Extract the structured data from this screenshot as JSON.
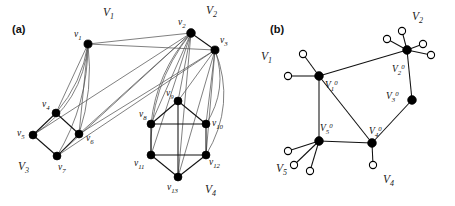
{
  "figure": {
    "panels": [
      {
        "id": "a",
        "label": "(a)",
        "label_x": 12,
        "label_y": 33,
        "set_labels": [
          {
            "name": "V1",
            "base": "V",
            "sub": "1",
            "x": 103,
            "y": 16
          },
          {
            "name": "V2",
            "base": "V",
            "sub": "2",
            "x": 206,
            "y": 14
          },
          {
            "name": "V3",
            "base": "V",
            "sub": "3",
            "x": 18,
            "y": 170
          },
          {
            "name": "V4",
            "base": "V",
            "sub": "4",
            "x": 205,
            "y": 193
          }
        ],
        "vertices": [
          {
            "id": "v1",
            "base": "v",
            "sub": "1",
            "x": 88,
            "y": 44,
            "r": 4.1,
            "lx": 74,
            "ly": 37
          },
          {
            "id": "v2",
            "base": "v",
            "sub": "2",
            "x": 191,
            "y": 33,
            "r": 4.4,
            "lx": 178,
            "ly": 25
          },
          {
            "id": "v3",
            "base": "v",
            "sub": "3",
            "x": 215,
            "y": 50,
            "r": 4.1,
            "lx": 220,
            "ly": 43
          },
          {
            "id": "v4",
            "base": "v",
            "sub": "4",
            "x": 56,
            "y": 113,
            "r": 4.0,
            "lx": 42,
            "ly": 107
          },
          {
            "id": "v5",
            "base": "v",
            "sub": "5",
            "x": 33,
            "y": 135,
            "r": 4.0,
            "lx": 17,
            "ly": 136
          },
          {
            "id": "v6",
            "base": "v",
            "sub": "6",
            "x": 79,
            "y": 134,
            "r": 4.0,
            "lx": 86,
            "ly": 141
          },
          {
            "id": "v7",
            "base": "v",
            "sub": "7",
            "x": 57,
            "y": 156,
            "r": 4.0,
            "lx": 58,
            "ly": 170
          },
          {
            "id": "v8",
            "base": "v",
            "sub": "8",
            "x": 151,
            "y": 124,
            "r": 4.0,
            "lx": 139,
            "ly": 117
          },
          {
            "id": "v9",
            "base": "v",
            "sub": "9",
            "x": 178,
            "y": 101,
            "r": 4.0,
            "lx": 166,
            "ly": 96
          },
          {
            "id": "v10",
            "base": "v",
            "sub": "10",
            "x": 206,
            "y": 124,
            "r": 4.0,
            "lx": 212,
            "ly": 126
          },
          {
            "id": "v11",
            "base": "v",
            "sub": "11",
            "x": 151,
            "y": 155,
            "r": 4.0,
            "lx": 134,
            "ly": 166
          },
          {
            "id": "v12",
            "base": "v",
            "sub": "12",
            "x": 206,
            "y": 155,
            "r": 4.0,
            "lx": 209,
            "ly": 165
          },
          {
            "id": "v13",
            "base": "v",
            "sub": "13",
            "x": 178,
            "y": 177,
            "r": 4.0,
            "lx": 167,
            "ly": 190
          }
        ],
        "edges_straight": [
          {
            "from": "v4",
            "to": "v5"
          },
          {
            "from": "v4",
            "to": "v6"
          },
          {
            "from": "v5",
            "to": "v7"
          },
          {
            "from": "v6",
            "to": "v7"
          },
          {
            "from": "v8",
            "to": "v9"
          },
          {
            "from": "v9",
            "to": "v10"
          },
          {
            "from": "v8",
            "to": "v10"
          },
          {
            "from": "v8",
            "to": "v11"
          },
          {
            "from": "v10",
            "to": "v12"
          },
          {
            "from": "v11",
            "to": "v12"
          },
          {
            "from": "v11",
            "to": "v13"
          },
          {
            "from": "v12",
            "to": "v13"
          },
          {
            "from": "v9",
            "to": "v13"
          },
          {
            "from": "v2",
            "to": "v3"
          }
        ],
        "edges_cross": [
          {
            "from": "v1",
            "to": "v2"
          },
          {
            "from": "v1",
            "to": "v3"
          },
          {
            "from": "v1",
            "to": "v4"
          },
          {
            "from": "v1",
            "to": "v6"
          },
          {
            "from": "v2",
            "to": "v5"
          },
          {
            "from": "v2",
            "to": "v6"
          },
          {
            "from": "v2",
            "to": "v7"
          },
          {
            "from": "v3",
            "to": "v6"
          },
          {
            "from": "v3",
            "to": "v7"
          },
          {
            "from": "v2",
            "to": "v8"
          },
          {
            "from": "v2",
            "to": "v9"
          },
          {
            "from": "v2",
            "to": "v11"
          },
          {
            "from": "v2",
            "to": "v13"
          },
          {
            "from": "v3",
            "to": "v9"
          },
          {
            "from": "v3",
            "to": "v10"
          },
          {
            "from": "v3",
            "to": "v13"
          },
          {
            "from": "v3",
            "to": "v12"
          }
        ],
        "edges_curved": [
          {
            "from": "v1",
            "to": "v5",
            "bow": -26
          },
          {
            "from": "v1",
            "to": "v7",
            "bow": -16
          },
          {
            "from": "v1",
            "to": "v4",
            "bow": -11
          },
          {
            "from": "v1",
            "to": "v6",
            "bow": -10
          },
          {
            "from": "v2",
            "to": "v8",
            "bow": 16
          },
          {
            "from": "v2",
            "to": "v11",
            "bow": 24
          },
          {
            "from": "v3",
            "to": "v10",
            "bow": -18
          },
          {
            "from": "v3",
            "to": "v12",
            "bow": -26
          }
        ]
      },
      {
        "id": "b",
        "label": "(b)",
        "label_x": 270,
        "label_y": 33,
        "set_labels": [
          {
            "name": "V1",
            "base": "V",
            "sub": "1",
            "x": 261,
            "y": 60
          },
          {
            "name": "V2",
            "base": "V",
            "sub": "2",
            "x": 412,
            "y": 20
          },
          {
            "name": "V4",
            "base": "V",
            "sub": "4",
            "x": 383,
            "y": 183
          },
          {
            "name": "V5",
            "base": "V",
            "sub": "5",
            "x": 276,
            "y": 172
          }
        ],
        "core_vertices": [
          {
            "id": "V1_0",
            "base": "V",
            "sub": "1",
            "sup": "0",
            "x": 319,
            "y": 76,
            "r": 4.4,
            "lx": 325,
            "ly": 88
          },
          {
            "id": "V2_0",
            "base": "V",
            "sub": "2",
            "sup": "0",
            "x": 407,
            "y": 50,
            "r": 4.4,
            "lx": 392,
            "ly": 72
          },
          {
            "id": "V3_0",
            "base": "V",
            "sub": "3",
            "sup": "0",
            "x": 412,
            "y": 100,
            "r": 4.4,
            "lx": 386,
            "ly": 99
          },
          {
            "id": "V4_0",
            "base": "V",
            "sub": "4",
            "sup": "0",
            "x": 372,
            "y": 143,
            "r": 4.4,
            "lx": 369,
            "ly": 134
          },
          {
            "id": "V5_0",
            "base": "V",
            "sub": "5",
            "sup": "0",
            "x": 319,
            "y": 141,
            "r": 4.4,
            "lx": 320,
            "ly": 131
          }
        ],
        "core_edges": [
          {
            "from": "V1_0",
            "to": "V2_0"
          },
          {
            "from": "V1_0",
            "to": "V4_0"
          },
          {
            "from": "V1_0",
            "to": "V5_0"
          },
          {
            "from": "V2_0",
            "to": "V3_0"
          },
          {
            "from": "V3_0",
            "to": "V4_0"
          },
          {
            "from": "V4_0",
            "to": "V5_0"
          }
        ],
        "satellites": [
          {
            "parent": "V1_0",
            "x": 303,
            "y": 54,
            "r": 3.6
          },
          {
            "parent": "V1_0",
            "x": 288,
            "y": 76,
            "r": 3.6
          },
          {
            "parent": "V2_0",
            "x": 402,
            "y": 31,
            "r": 3.6
          },
          {
            "parent": "V2_0",
            "x": 387,
            "y": 39,
            "r": 3.6
          },
          {
            "parent": "V2_0",
            "x": 423,
            "y": 44,
            "r": 3.6
          },
          {
            "parent": "V2_0",
            "x": 431,
            "y": 55,
            "r": 3.6
          },
          {
            "parent": "V4_0",
            "x": 373,
            "y": 165,
            "r": 3.6
          },
          {
            "parent": "V5_0",
            "x": 288,
            "y": 151,
            "r": 3.6
          },
          {
            "parent": "V5_0",
            "x": 294,
            "y": 165,
            "r": 3.6
          },
          {
            "parent": "V5_0",
            "x": 310,
            "y": 171,
            "r": 3.6
          }
        ]
      }
    ],
    "colors": {
      "edge_dark": "#111111",
      "edge_light": "#555555",
      "node_fill": "#000000",
      "node_hollow_fill": "#ffffff",
      "background": "#ffffff"
    }
  }
}
